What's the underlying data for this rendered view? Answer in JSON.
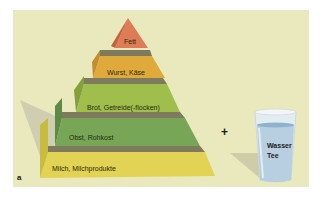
{
  "figure": {
    "panel_letter": "a",
    "plus_sign": "+",
    "background_color": "#e9e9bd"
  },
  "pyramid": {
    "tiers": [
      {
        "label": "Fett",
        "color": "#e07c55"
      },
      {
        "label": "Wurst, Käse",
        "color": "#e0a93c"
      },
      {
        "label": "Brot, Getreide(-flocken)",
        "color": "#9fbe4c"
      },
      {
        "label": "Obst, Rohkost",
        "color": "#77a657"
      },
      {
        "label": "Milch, Milchprodukte",
        "color": "#e2d354"
      }
    ],
    "separator_color": "#7d7a5e"
  },
  "glass": {
    "label_line1": "Wasser",
    "label_line2": "Tee",
    "water_color": "#a9c6dc"
  }
}
